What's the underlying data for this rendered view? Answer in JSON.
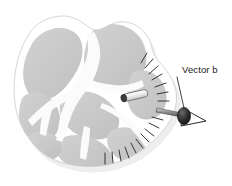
{
  "figure": {
    "background_color": "#ffffff",
    "width": 232,
    "height": 186
  },
  "annotations": [
    {
      "id": "vector-b",
      "label": "Vector b",
      "label_x": 168,
      "label_y": 70,
      "leader_from": [
        176,
        76
      ],
      "leader_to": [
        166,
        104
      ],
      "arrow_tail": [
        158,
        110
      ],
      "arrow_tip": [
        203,
        120
      ],
      "arrow_color": "#1c1c1c"
    }
  ],
  "objects": {
    "implant": {
      "name": "electrode-cylinder",
      "start": [
        122,
        99
      ],
      "end": [
        146,
        93
      ],
      "body_color": "#e8e8e8",
      "cap_color": "#4a4a4a",
      "outline_color": "#555555"
    },
    "hatching": {
      "name": "radial-hatch-marks",
      "count": 17,
      "stroke_color": "#333333",
      "description": "short radial tick marks fanning along the right and lower-right border"
    }
  },
  "colors": {
    "gray_matter": "#c9c9c9",
    "gray_matter_dark": "#bdbdbd",
    "white_matter": "#fafafa",
    "outer_rim": "#ffffff",
    "outline": "#d8d8d8",
    "shadow": "#ebebeb",
    "text": "#1a1a1a"
  }
}
